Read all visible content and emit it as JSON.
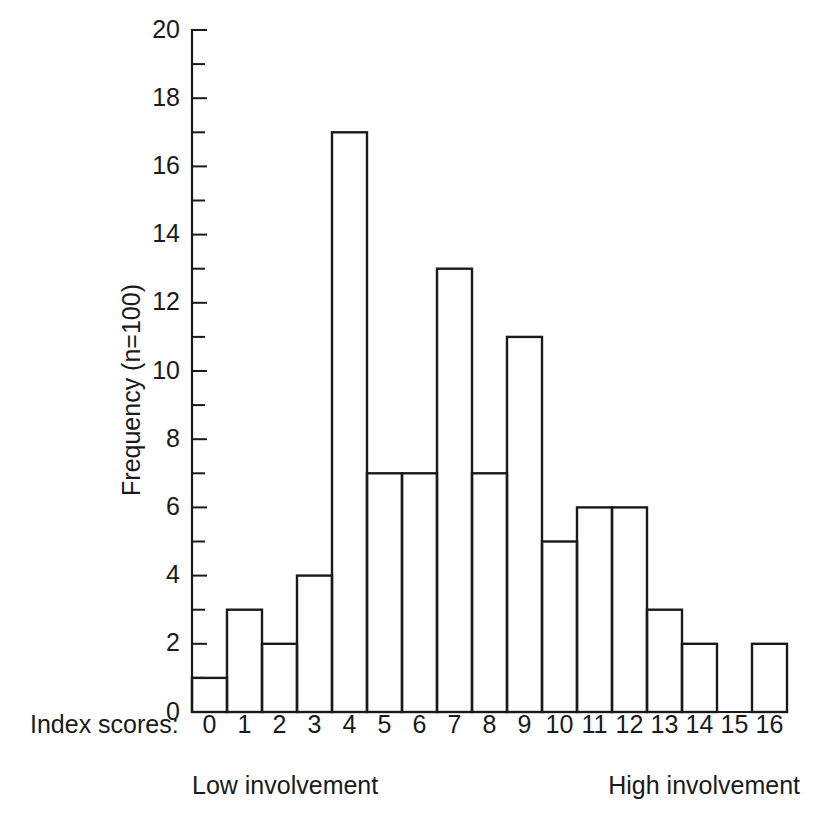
{
  "figure": {
    "background_color": "#ffffff",
    "ink_color": "#1a1a1a"
  },
  "labels": {
    "x_axis_name": "Index scores:",
    "caption_left": "Low involvement",
    "caption_right": "High involvement",
    "y_axis_title": "Frequency (n=100)"
  },
  "chart_data": {
    "type": "bar",
    "title": "",
    "subtitle": "",
    "xlabel": "Index scores:",
    "ylabel": "Frequency (n=100)",
    "categories": [
      "0",
      "1",
      "2",
      "3",
      "4",
      "5",
      "6",
      "7",
      "8",
      "9",
      "10",
      "11",
      "12",
      "13",
      "14",
      "15",
      "16"
    ],
    "values": [
      1,
      3,
      2,
      4,
      17,
      7,
      7,
      13,
      7,
      11,
      5,
      6,
      6,
      3,
      2,
      0,
      2
    ],
    "total": 100,
    "xlim": [
      0,
      17
    ],
    "ylim": [
      0,
      20
    ],
    "y_major_ticks": [
      0,
      2,
      4,
      6,
      8,
      10,
      12,
      14,
      16,
      18,
      20
    ],
    "y_minor_ticks": [
      1,
      3,
      5,
      7,
      9,
      11,
      13,
      15,
      17,
      19
    ],
    "y_tick_labels": [
      "0",
      "2",
      "4",
      "6",
      "8",
      "10",
      "12",
      "14",
      "16",
      "18",
      "20"
    ],
    "grid": false,
    "legend": false,
    "legend_position": "none",
    "annotations": [
      "Low involvement",
      "High involvement"
    ],
    "bar_style": "outline",
    "bar_fill": "#ffffff",
    "bar_stroke": "#1a1a1a"
  }
}
